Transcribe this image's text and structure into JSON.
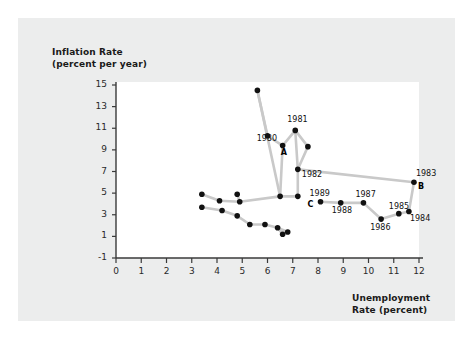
{
  "figure": {
    "background_color": "#ffffff",
    "panel_color": "#eceded",
    "plot_area_color": "#ffffff",
    "line_color": "#c9c9c9",
    "point_color": "#111111"
  },
  "chart_data": {
    "type": "scatter",
    "title": "",
    "xlabel_line1": "Unemployment",
    "xlabel_line2": "Rate (percent)",
    "ylabel_line1": "Inflation Rate",
    "ylabel_line2": "(percent per year)",
    "xlim": [
      0,
      12
    ],
    "ylim": [
      -1,
      15
    ],
    "xticks": [
      0,
      1,
      2,
      3,
      4,
      5,
      6,
      7,
      8,
      9,
      10,
      11,
      12
    ],
    "yticks": [
      -1,
      1,
      3,
      5,
      7,
      9,
      11,
      13,
      15
    ],
    "grid": false,
    "legend": "none",
    "connected": true,
    "xtick_labels": [
      "0",
      "1",
      "2",
      "3",
      "4",
      "5",
      "6",
      "7",
      "8",
      "9",
      "10",
      "11",
      "12"
    ],
    "ytick_labels": [
      "-1",
      "1",
      "3",
      "5",
      "7",
      "9",
      "11",
      "13",
      "15"
    ],
    "points": [
      {
        "x": 5.6,
        "y": 14.5,
        "label": "",
        "marker": ""
      },
      {
        "x": 6.0,
        "y": 10.3,
        "label": "",
        "marker": ""
      },
      {
        "x": 6.6,
        "y": 9.4,
        "label": "1980",
        "marker": "A"
      },
      {
        "x": 7.1,
        "y": 10.8,
        "label": "1981",
        "marker": ""
      },
      {
        "x": 7.6,
        "y": 9.3,
        "label": "",
        "marker": ""
      },
      {
        "x": 7.2,
        "y": 7.2,
        "label": "1982",
        "marker": ""
      },
      {
        "x": 6.5,
        "y": 4.7,
        "label": "",
        "marker": ""
      },
      {
        "x": 7.2,
        "y": 4.7,
        "label": "",
        "marker": ""
      },
      {
        "x": 8.1,
        "y": 4.2,
        "label": "1989",
        "marker": "C"
      },
      {
        "x": 8.9,
        "y": 4.1,
        "label": "1988",
        "marker": ""
      },
      {
        "x": 9.8,
        "y": 4.1,
        "label": "1987",
        "marker": ""
      },
      {
        "x": 10.5,
        "y": 2.6,
        "label": "1986",
        "marker": ""
      },
      {
        "x": 11.2,
        "y": 3.1,
        "label": "1985",
        "marker": ""
      },
      {
        "x": 11.6,
        "y": 3.3,
        "label": "1984",
        "marker": ""
      },
      {
        "x": 11.8,
        "y": 6.0,
        "label": "1983",
        "marker": "B"
      },
      {
        "x": 3.4,
        "y": 4.9,
        "label": "",
        "marker": ""
      },
      {
        "x": 3.4,
        "y": 3.7,
        "label": "",
        "marker": ""
      },
      {
        "x": 4.1,
        "y": 4.3,
        "label": "",
        "marker": ""
      },
      {
        "x": 4.2,
        "y": 3.4,
        "label": "",
        "marker": ""
      },
      {
        "x": 4.8,
        "y": 4.9,
        "label": "",
        "marker": ""
      },
      {
        "x": 4.9,
        "y": 4.2,
        "label": "",
        "marker": ""
      },
      {
        "x": 4.8,
        "y": 2.9,
        "label": "",
        "marker": ""
      },
      {
        "x": 5.3,
        "y": 2.1,
        "label": "",
        "marker": ""
      },
      {
        "x": 5.9,
        "y": 2.1,
        "label": "",
        "marker": ""
      },
      {
        "x": 6.4,
        "y": 1.8,
        "label": "",
        "marker": ""
      },
      {
        "x": 6.8,
        "y": 1.4,
        "label": "",
        "marker": ""
      },
      {
        "x": 6.6,
        "y": 1.2,
        "label": "",
        "marker": ""
      }
    ],
    "segments": [
      [
        [
          5.6,
          14.5
        ],
        [
          6.0,
          10.3
        ]
      ],
      [
        [
          6.0,
          10.3
        ],
        [
          6.6,
          9.4
        ]
      ],
      [
        [
          5.6,
          14.5
        ],
        [
          6.5,
          4.7
        ]
      ],
      [
        [
          6.6,
          9.4
        ],
        [
          7.1,
          10.8
        ]
      ],
      [
        [
          7.1,
          10.8
        ],
        [
          7.6,
          9.3
        ]
      ],
      [
        [
          7.1,
          10.8
        ],
        [
          7.2,
          7.2
        ]
      ],
      [
        [
          6.6,
          9.4
        ],
        [
          6.5,
          4.7
        ]
      ],
      [
        [
          7.6,
          9.3
        ],
        [
          7.2,
          7.2
        ]
      ],
      [
        [
          7.2,
          7.2
        ],
        [
          7.2,
          4.7
        ]
      ],
      [
        [
          6.5,
          4.7
        ],
        [
          7.2,
          4.7
        ]
      ],
      [
        [
          7.2,
          7.2
        ],
        [
          11.8,
          6.0
        ]
      ],
      [
        [
          8.1,
          4.2
        ],
        [
          8.9,
          4.1
        ]
      ],
      [
        [
          8.9,
          4.1
        ],
        [
          9.8,
          4.1
        ]
      ],
      [
        [
          9.8,
          4.1
        ],
        [
          10.5,
          2.6
        ]
      ],
      [
        [
          10.5,
          2.6
        ],
        [
          11.2,
          3.1
        ]
      ],
      [
        [
          11.2,
          3.1
        ],
        [
          11.6,
          3.3
        ]
      ],
      [
        [
          11.6,
          3.3
        ],
        [
          11.8,
          6.0
        ]
      ],
      [
        [
          3.4,
          4.9
        ],
        [
          4.1,
          4.3
        ]
      ],
      [
        [
          4.1,
          4.3
        ],
        [
          4.9,
          4.2
        ]
      ],
      [
        [
          4.9,
          4.2
        ],
        [
          6.5,
          4.7
        ]
      ],
      [
        [
          3.4,
          3.7
        ],
        [
          4.2,
          3.4
        ]
      ],
      [
        [
          4.2,
          3.4
        ],
        [
          4.8,
          2.9
        ]
      ],
      [
        [
          4.8,
          2.9
        ],
        [
          5.3,
          2.1
        ]
      ],
      [
        [
          5.3,
          2.1
        ],
        [
          5.9,
          2.1
        ]
      ],
      [
        [
          5.9,
          2.1
        ],
        [
          6.4,
          1.8
        ]
      ],
      [
        [
          6.4,
          1.8
        ],
        [
          6.8,
          1.4
        ]
      ],
      [
        [
          4.8,
          4.9
        ],
        [
          4.9,
          4.2
        ]
      ],
      [
        [
          6.4,
          1.8
        ],
        [
          6.6,
          1.2
        ]
      ]
    ]
  }
}
